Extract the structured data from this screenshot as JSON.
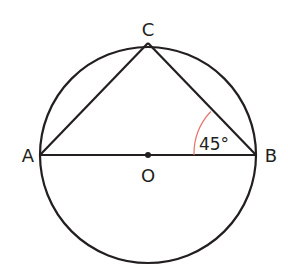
{
  "diagram": {
    "points": {
      "A": {
        "label": "A",
        "x": 40,
        "y": 155
      },
      "B": {
        "label": "B",
        "x": 256,
        "y": 155
      },
      "C": {
        "label": "C",
        "x": 148,
        "y": 43
      },
      "O": {
        "label": "O",
        "x": 148,
        "y": 155
      }
    },
    "circle": {
      "cx": 148,
      "cy": 155,
      "r": 108
    },
    "angle": {
      "vertex": "B",
      "label": "45°",
      "value": 45,
      "color": "#e8736b"
    },
    "colors": {
      "stroke": "#231f20",
      "angle_arc": "#e8736b",
      "background": "#ffffff"
    }
  }
}
